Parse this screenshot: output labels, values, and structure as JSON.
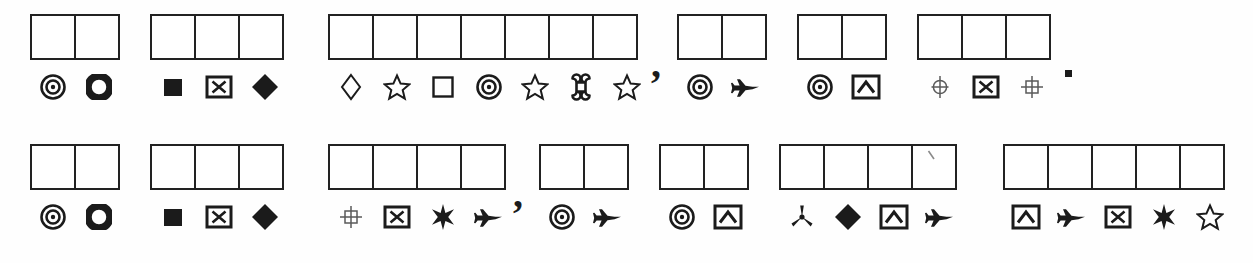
{
  "document": {
    "type": "symbol-substitution-cipher-worksheet",
    "description": "Two lines of blank answer boxes with cipher symbols printed beneath each box",
    "ink_color": "#1b1b1b",
    "paper_color": "#ffffff",
    "box_count_total": 37
  },
  "legend": {
    "target": "concentric-circles-target-icon",
    "donut": "donut-ring-icon",
    "filled-square": "filled-square-icon",
    "boxed-x": "boxed-x-icon",
    "filled-diamond": "filled-diamond-icon",
    "open-diamond": "outline-diamond-icon",
    "open-star": "outline-star-icon",
    "open-square": "outline-square-icon",
    "command": "command-cloverleaf-icon",
    "airplane": "airplane-icon",
    "boxed-chevron": "boxed-chevron-icon",
    "crosshair-circle": "crosshair-circle-icon",
    "crosshatch": "crosshatch-icon",
    "filled-star6": "filled-six-point-star-icon",
    "trefoil": "trefoil-propeller-icon"
  },
  "lines": [
    {
      "index": 1,
      "words": [
        {
          "id": "r1w1",
          "cells": 2,
          "symbols": [
            "target",
            "donut"
          ]
        },
        {
          "id": "r1w2",
          "cells": 3,
          "symbols": [
            "filled-square",
            "boxed-x",
            "filled-diamond"
          ]
        },
        {
          "id": "r1w3",
          "cells": 7,
          "symbols": [
            "open-diamond",
            "open-star",
            "open-square",
            "target",
            "open-star",
            "command",
            "open-star"
          ],
          "trailing_punctuation": ","
        },
        {
          "id": "r1w4",
          "cells": 2,
          "symbols": [
            "target",
            "airplane"
          ]
        },
        {
          "id": "r1w5",
          "cells": 2,
          "symbols": [
            "target",
            "boxed-chevron"
          ]
        },
        {
          "id": "r1w6",
          "cells": 3,
          "symbols": [
            "crosshair-circle",
            "boxed-x",
            "crosshatch"
          ],
          "trailing_punctuation": "."
        }
      ]
    },
    {
      "index": 2,
      "words": [
        {
          "id": "r2w1",
          "cells": 2,
          "symbols": [
            "target",
            "donut"
          ]
        },
        {
          "id": "r2w2",
          "cells": 3,
          "symbols": [
            "filled-square",
            "boxed-x",
            "filled-diamond"
          ]
        },
        {
          "id": "r2w3",
          "cells": 4,
          "symbols": [
            "crosshatch",
            "boxed-x",
            "filled-star6",
            "airplane"
          ],
          "trailing_punctuation": ","
        },
        {
          "id": "r2w4",
          "cells": 2,
          "symbols": [
            "target",
            "airplane"
          ]
        },
        {
          "id": "r2w5",
          "cells": 2,
          "symbols": [
            "target",
            "boxed-chevron"
          ]
        },
        {
          "id": "r2w6",
          "cells": 4,
          "symbols": [
            "trefoil",
            "filled-diamond",
            "boxed-chevron",
            "airplane"
          ],
          "stray_pencil_mark_cell": 4
        },
        {
          "id": "r2w7",
          "cells": 5,
          "symbols": [
            "boxed-chevron",
            "airplane",
            "boxed-x",
            "filled-star6",
            "open-star"
          ]
        }
      ]
    }
  ],
  "punctuation": {
    "comma": ",",
    "period": "."
  }
}
